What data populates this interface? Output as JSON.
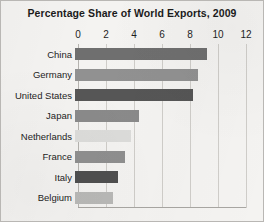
{
  "chart_data": {
    "type": "bar",
    "orientation": "horizontal",
    "title": "Percentage Share of World Exports, 2009",
    "xlabel": "",
    "ylabel": "",
    "xlim": [
      0,
      12
    ],
    "xticks": [
      0,
      2,
      4,
      6,
      8,
      10,
      12
    ],
    "xtick_labels": [
      "0",
      "2",
      "4",
      "6",
      "8",
      "10",
      "12"
    ],
    "grid": true,
    "legend": "none",
    "categories": [
      "China",
      "Germany",
      "United States",
      "Japan",
      "Netherlands",
      "France",
      "Italy",
      "Belgium"
    ],
    "values": [
      9.4,
      8.8,
      8.4,
      4.6,
      4.0,
      3.6,
      3.1,
      2.7
    ],
    "bar_colors": [
      "#6f6f6f",
      "#919191",
      "#565656",
      "#8a8a8a",
      "#dcdcda",
      "#8f8f8f",
      "#4f4f4f",
      "#b9b9b7"
    ],
    "bars": [
      {
        "label": "China",
        "value": 9.4,
        "color": "#6f6f6f"
      },
      {
        "label": "Germany",
        "value": 8.8,
        "color": "#919191"
      },
      {
        "label": "United States",
        "value": 8.4,
        "color": "#565656"
      },
      {
        "label": "Japan",
        "value": 4.6,
        "color": "#8a8a8a"
      },
      {
        "label": "Netherlands",
        "value": 4.0,
        "color": "#dcdcda"
      },
      {
        "label": "France",
        "value": 3.6,
        "color": "#8f8f8f"
      },
      {
        "label": "Italy",
        "value": 3.1,
        "color": "#4f4f4f"
      },
      {
        "label": "Belgium",
        "value": 2.7,
        "color": "#b9b9b7"
      }
    ]
  },
  "colors": {
    "page_background": "#f4f3f1",
    "border": "#b9b7b4",
    "gridline": "#cfcdc9",
    "axis": "#a8a6a2",
    "text": "#1d1d1d"
  }
}
